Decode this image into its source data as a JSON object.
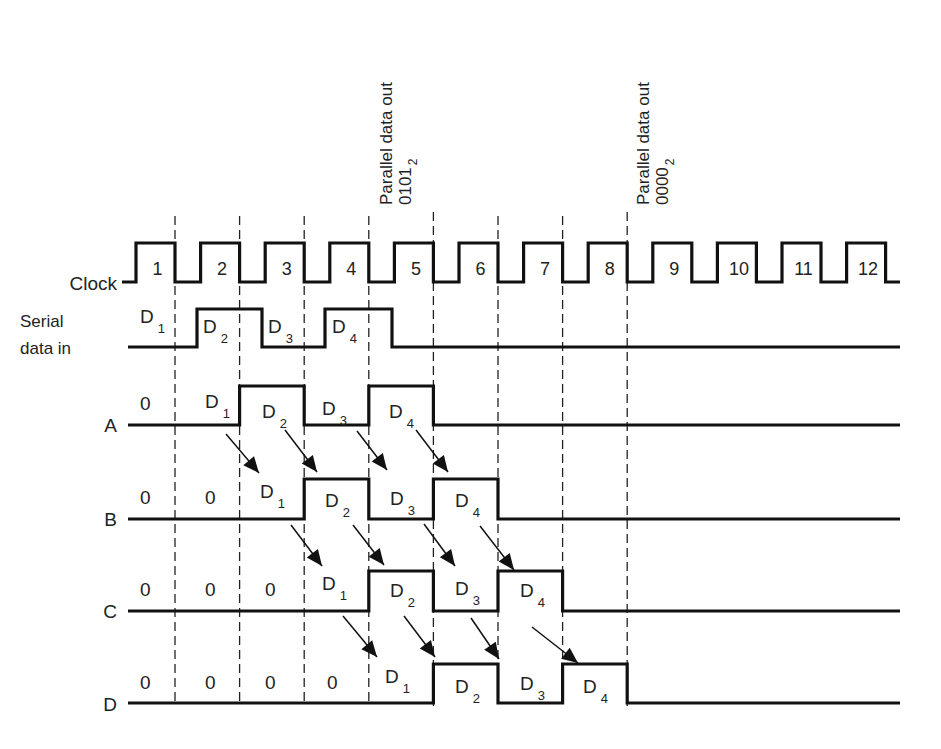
{
  "diagram": {
    "type": "timing-diagram"
  },
  "annotations": [
    {
      "text": "Parallel data out",
      "value": "0101",
      "subscript": "2",
      "x": 383
    },
    {
      "text": "Parallel data out",
      "value": "0000",
      "subscript": "2",
      "x": 640
    }
  ],
  "signals": {
    "clock": {
      "label": "Clock",
      "pulses": [
        "1",
        "2",
        "3",
        "4",
        "5",
        "6",
        "7",
        "8",
        "9",
        "10",
        "11",
        "12"
      ]
    },
    "serial": {
      "label_line1": "Serial",
      "label_line2": "data in",
      "segments": [
        {
          "main": "D",
          "sub": "1",
          "x": 140,
          "y": 323
        },
        {
          "main": "D",
          "sub": "2",
          "x": 203,
          "y": 333
        },
        {
          "main": "D",
          "sub": "3",
          "x": 268,
          "y": 333
        },
        {
          "main": "D",
          "sub": "4",
          "x": 332,
          "y": 333
        }
      ]
    },
    "A": {
      "label": "A",
      "values": [
        {
          "main": "0",
          "sub": "",
          "x": 140,
          "y": 410
        },
        {
          "main": "D",
          "sub": "1",
          "x": 205,
          "y": 408
        },
        {
          "main": "D",
          "sub": "2",
          "x": 262,
          "y": 418
        },
        {
          "main": "D",
          "sub": "3",
          "x": 322,
          "y": 415
        },
        {
          "main": "D",
          "sub": "4",
          "x": 389,
          "y": 418
        }
      ]
    },
    "B": {
      "label": "B",
      "values": [
        {
          "main": "0",
          "sub": "",
          "x": 140,
          "y": 504
        },
        {
          "main": "0",
          "sub": "",
          "x": 205,
          "y": 504
        },
        {
          "main": "D",
          "sub": "1",
          "x": 260,
          "y": 498
        },
        {
          "main": "D",
          "sub": "2",
          "x": 325,
          "y": 507
        },
        {
          "main": "D",
          "sub": "3",
          "x": 390,
          "y": 505
        },
        {
          "main": "D",
          "sub": "4",
          "x": 455,
          "y": 507
        }
      ]
    },
    "C": {
      "label": "C",
      "values": [
        {
          "main": "0",
          "sub": "",
          "x": 140,
          "y": 596
        },
        {
          "main": "0",
          "sub": "",
          "x": 205,
          "y": 596
        },
        {
          "main": "0",
          "sub": "",
          "x": 265,
          "y": 596
        },
        {
          "main": "D",
          "sub": "1",
          "x": 322,
          "y": 590
        },
        {
          "main": "D",
          "sub": "2",
          "x": 390,
          "y": 597
        },
        {
          "main": "D",
          "sub": "3",
          "x": 455,
          "y": 595
        },
        {
          "main": "D",
          "sub": "4",
          "x": 520,
          "y": 597
        }
      ]
    },
    "D": {
      "label": "D",
      "values": [
        {
          "main": "0",
          "sub": "",
          "x": 140,
          "y": 689
        },
        {
          "main": "0",
          "sub": "",
          "x": 205,
          "y": 689
        },
        {
          "main": "0",
          "sub": "",
          "x": 265,
          "y": 689
        },
        {
          "main": "0",
          "sub": "",
          "x": 327,
          "y": 689
        },
        {
          "main": "D",
          "sub": "1",
          "x": 385,
          "y": 683
        },
        {
          "main": "D",
          "sub": "2",
          "x": 455,
          "y": 693
        },
        {
          "main": "D",
          "sub": "3",
          "x": 520,
          "y": 690
        },
        {
          "main": "D",
          "sub": "4",
          "x": 583,
          "y": 693
        }
      ]
    }
  },
  "colors": {
    "ink": "#111111",
    "background": "#ffffff"
  }
}
